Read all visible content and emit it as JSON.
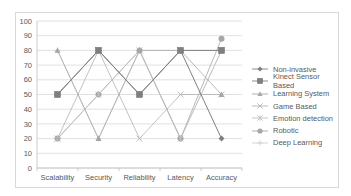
{
  "chart_data": {
    "type": "line",
    "title": "",
    "xlabel": "",
    "ylabel": "",
    "ylim": [
      0,
      100
    ],
    "yticks": [
      0,
      10,
      20,
      30,
      40,
      50,
      60,
      70,
      80,
      90,
      100
    ],
    "grid": true,
    "legend_position": "right",
    "categories": [
      "Scalability",
      "Security",
      "Reliability",
      "Latency",
      "Accuracy"
    ],
    "series": [
      {
        "name": "Non-invasive",
        "marker": "diamond",
        "color": "#7f7f7f",
        "values": [
          50,
          80,
          50,
          80,
          20
        ]
      },
      {
        "name": "Kinect Sensor Based",
        "marker": "square",
        "color": "#808080",
        "values": [
          50,
          80,
          50,
          80,
          80
        ]
      },
      {
        "name": "Learning System",
        "marker": "triangle",
        "color": "#a6a6a6",
        "values": [
          80,
          20,
          80,
          80,
          50
        ]
      },
      {
        "name": "Game Based",
        "marker": "x",
        "color": "#b3b3b3",
        "values": [
          20,
          80,
          20,
          50,
          50
        ]
      },
      {
        "name": "Emotion detection",
        "marker": "asterisk",
        "color": "#bfbfbf",
        "values": [
          20,
          50,
          80,
          20,
          80
        ]
      },
      {
        "name": "Robotic",
        "marker": "circle",
        "color": "#a6a6a6",
        "values": [
          20,
          50,
          80,
          20,
          88
        ]
      },
      {
        "name": "Deep Learning",
        "marker": "plus",
        "color": "#d0d0d0",
        "values": [
          80,
          20,
          80,
          20,
          80
        ]
      }
    ]
  }
}
